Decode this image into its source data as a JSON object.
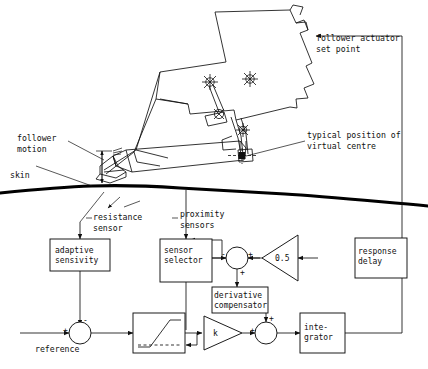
{
  "figure": {
    "type": "engineering-control-block-diagram"
  },
  "annotations": {
    "follower_actuator_set_point": "follower actuator\nset point",
    "typical_position_virtual_centre": "typical position of\nvirtual centre",
    "follower_motion": "follower\nmotion",
    "skin": "skin",
    "resistance_sensor": "resistance\nsensor",
    "proximity_sensors": "proximity\nsensors",
    "reference": "reference"
  },
  "blocks": {
    "adaptive_sensivity": "adaptive\nsensivity",
    "sensor_selector": "sensor\nselector",
    "derivative_compensator": "derivative\ncompensator",
    "response_delay": "response\ndelay",
    "integrator": "inte-\ngrator"
  },
  "gains": {
    "half": "0.5",
    "k": "k"
  },
  "signs": {
    "sum1_plus": "+",
    "sum1_minus": "-",
    "sum2_minus": "-",
    "sum2_plus": "+",
    "sum2_bottom": "+",
    "sum3_left": "+",
    "sum3_top": "+"
  },
  "colors": {
    "ink": "#101010",
    "skin_line": "#000000",
    "background": "#ffffff"
  }
}
